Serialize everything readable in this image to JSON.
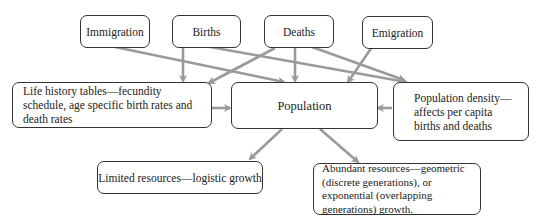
{
  "diagram": {
    "type": "flowchart",
    "top_nodes": {
      "immigration": "Immigration",
      "births": "Births",
      "deaths": "Deaths",
      "emigration": "Emigration"
    },
    "middle_nodes": {
      "life_history": "Life history tables—fecundity schedule, age specific birth rates and death rates",
      "population": "Population",
      "population_density": "Population density—affects per capita births and deaths"
    },
    "bottom_nodes": {
      "limited": "Limited resources—logistic growth",
      "abundant": "Abundant resources—geometric (discrete generations), or exponential (overlapping generations) growth."
    },
    "edges": [
      {
        "from": "Immigration",
        "to": "Population"
      },
      {
        "from": "Births",
        "to": "Life history tables"
      },
      {
        "from": "Births",
        "to": "Population density"
      },
      {
        "from": "Deaths",
        "to": "Life history tables"
      },
      {
        "from": "Deaths",
        "to": "Population"
      },
      {
        "from": "Deaths",
        "to": "Population density"
      },
      {
        "from": "Emigration",
        "to": "Population"
      },
      {
        "from": "Life history tables",
        "to": "Population"
      },
      {
        "from": "Population density",
        "to": "Population"
      },
      {
        "from": "Population",
        "to": "Limited resources"
      },
      {
        "from": "Population",
        "to": "Abundant resources"
      }
    ],
    "colors": {
      "arrow": "#9a9a9a",
      "border": "#333333"
    }
  }
}
